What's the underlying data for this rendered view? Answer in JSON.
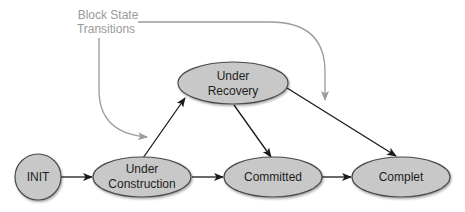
{
  "diagram": {
    "annotation": {
      "line1": "Block State",
      "line2": "Transitions"
    },
    "nodes": [
      {
        "id": "init",
        "label_lines": [
          "INIT"
        ]
      },
      {
        "id": "under_construction",
        "label_lines": [
          "Under",
          "Construction"
        ]
      },
      {
        "id": "under_recovery",
        "label_lines": [
          "Under",
          "Recovery"
        ]
      },
      {
        "id": "committed",
        "label_lines": [
          "Committed"
        ]
      },
      {
        "id": "complet",
        "label_lines": [
          "Complet"
        ]
      }
    ],
    "edges": [
      {
        "from": "init",
        "to": "under_construction"
      },
      {
        "from": "under_construction",
        "to": "committed"
      },
      {
        "from": "under_construction",
        "to": "under_recovery"
      },
      {
        "from": "under_recovery",
        "to": "committed"
      },
      {
        "from": "under_recovery",
        "to": "complet"
      },
      {
        "from": "committed",
        "to": "complet"
      }
    ],
    "colors": {
      "node_fill": "#c8c8c8",
      "node_stroke": "#4a4a4a",
      "edge": "#1a1a1a",
      "annotation": "#9a9a9a"
    }
  }
}
